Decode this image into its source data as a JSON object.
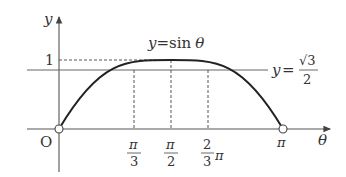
{
  "diagram": {
    "curve_label_y": "y",
    "curve_label_eq": "=",
    "curve_label_fn": "sin",
    "curve_label_var": "θ",
    "line_label_y": "y",
    "line_label_eq": "=",
    "line_label_num": "√3",
    "line_label_den": "2",
    "y_axis_label": "y",
    "x_axis_label": "θ",
    "origin_label": "O",
    "y_tick_1": "1",
    "x_ticks": [
      {
        "num": "π",
        "den": "3"
      },
      {
        "num": "π",
        "den": "2"
      },
      {
        "num": "2",
        "den": "3",
        "suffix": "π"
      }
    ],
    "x_end_label": "π",
    "colors": {
      "curve": "#222222",
      "axis": "#555555",
      "dashed": "#555555"
    }
  }
}
